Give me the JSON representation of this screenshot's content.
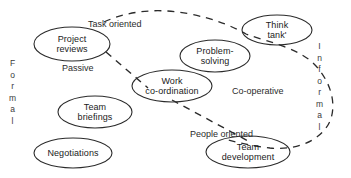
{
  "diagram": {
    "stroke_color": "#2b2b2b",
    "text_color": "#1a1a1a",
    "background": "#ffffff"
  },
  "axes": {
    "top_label": "Task oriented",
    "bottom_label": "People oriented",
    "left_label": "Passive",
    "right_label": "Co-operative",
    "left_vertical": "Formal",
    "right_vertical": "Informal",
    "left_vertical_letters": [
      "F",
      "o",
      "r",
      "m",
      "a",
      "l"
    ],
    "right_vertical_letters": [
      "I",
      "n",
      "f",
      "o",
      "r",
      "m",
      "a",
      "l"
    ]
  },
  "nodes": [
    {
      "id": "project-reviews",
      "line1": "Project",
      "line2": "reviews"
    },
    {
      "id": "think-tank",
      "line1": "Think",
      "line2": "tank'"
    },
    {
      "id": "problem-solving",
      "line1": "Problem-",
      "line2": "solving"
    },
    {
      "id": "work-coordination",
      "line1": "Work",
      "line2": "co-ordination"
    },
    {
      "id": "team-briefings",
      "line1": "Team",
      "line2": "briefings"
    },
    {
      "id": "negotiations",
      "line1": "Negotiations",
      "line2": ""
    },
    {
      "id": "team-development",
      "line1": "Team",
      "line2": "development"
    }
  ]
}
